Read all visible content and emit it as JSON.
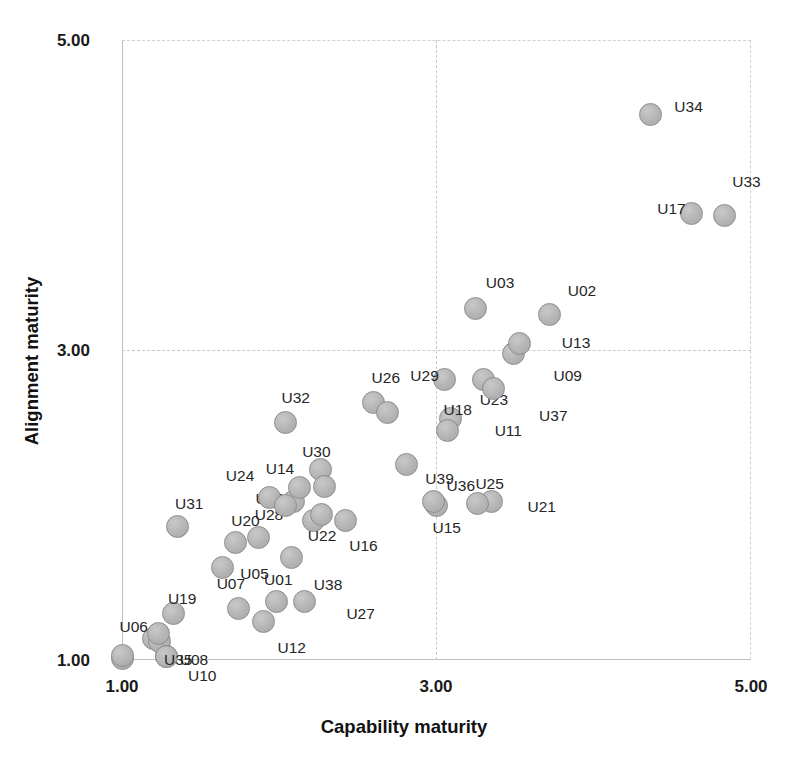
{
  "chart_data": {
    "type": "scatter",
    "title": "",
    "xlabel": "Capability maturity",
    "ylabel": "Alignment maturity",
    "xlim": [
      1.0,
      5.0
    ],
    "ylim": [
      1.0,
      5.0
    ],
    "xticks": [
      "1.00",
      "3.00",
      "5.00"
    ],
    "xtick_values": [
      1.0,
      3.0,
      5.0
    ],
    "yticks": [
      "1.00",
      "3.00",
      "5.00"
    ],
    "ytick_values": [
      1.0,
      3.0,
      5.0
    ],
    "grid": true,
    "legend": "none",
    "marker_fill": "#b4b4b4",
    "marker_edge": "#8c8c8c",
    "points": [
      {
        "label": "U01",
        "x": 1.98,
        "y": 1.38,
        "lx": -12,
        "ly": -22
      },
      {
        "label": "U02",
        "x": 3.72,
        "y": 3.23,
        "lx": 18,
        "ly": -24
      },
      {
        "label": "U03",
        "x": 3.25,
        "y": 3.27,
        "lx": 10,
        "ly": -26
      },
      {
        "label": "U04",
        "x": 2.09,
        "y": 2.02,
        "lx": -38,
        "ly": -4
      },
      {
        "label": "U05",
        "x": 1.74,
        "y": 1.33,
        "lx": 2,
        "ly": -36
      },
      {
        "label": "U06",
        "x": 1.2,
        "y": 1.14,
        "lx": -34,
        "ly": -12
      },
      {
        "label": "U07",
        "x": 1.64,
        "y": 1.6,
        "lx": -6,
        "ly": 16
      },
      {
        "label": "U08",
        "x": 1.24,
        "y": 1.12,
        "lx": 20,
        "ly": 18
      },
      {
        "label": "U09",
        "x": 3.49,
        "y": 2.98,
        "lx": 40,
        "ly": 22
      },
      {
        "label": "U10",
        "x": 1.28,
        "y": 1.02,
        "lx": 22,
        "ly": 18
      },
      {
        "label": "U11",
        "x": 3.09,
        "y": 2.56,
        "lx": 44,
        "ly": 12
      },
      {
        "label": "U12",
        "x": 1.9,
        "y": 1.25,
        "lx": 14,
        "ly": 26
      },
      {
        "label": "U13",
        "x": 3.53,
        "y": 3.04,
        "lx": 42,
        "ly": -2
      },
      {
        "label": "U14",
        "x": 2.13,
        "y": 2.11,
        "lx": -34,
        "ly": -20
      },
      {
        "label": "U15",
        "x": 3.0,
        "y": 2.0,
        "lx": -4,
        "ly": 22
      },
      {
        "label": "U16",
        "x": 2.42,
        "y": 1.9,
        "lx": 4,
        "ly": 24
      },
      {
        "label": "U17",
        "x": 4.62,
        "y": 3.88,
        "lx": -34,
        "ly": -6
      },
      {
        "label": "U18",
        "x": 3.07,
        "y": 2.48,
        "lx": -4,
        "ly": -22
      },
      {
        "label": "U19",
        "x": 1.33,
        "y": 1.3,
        "lx": -6,
        "ly": -16
      },
      {
        "label": "U20",
        "x": 1.72,
        "y": 1.76,
        "lx": -4,
        "ly": -22
      },
      {
        "label": "U21",
        "x": 3.35,
        "y": 2.02,
        "lx": 36,
        "ly": 4
      },
      {
        "label": "U22",
        "x": 2.22,
        "y": 1.9,
        "lx": -6,
        "ly": 14
      },
      {
        "label": "U23",
        "x": 3.3,
        "y": 2.81,
        "lx": -4,
        "ly": 20
      },
      {
        "label": "U24",
        "x": 1.94,
        "y": 2.05,
        "lx": -44,
        "ly": -22
      },
      {
        "label": "U25",
        "x": 3.26,
        "y": 2.01,
        "lx": -2,
        "ly": -20
      },
      {
        "label": "U26",
        "x": 2.6,
        "y": 2.66,
        "lx": -2,
        "ly": -26
      },
      {
        "label": "U27",
        "x": 2.16,
        "y": 1.38,
        "lx": 42,
        "ly": 12
      },
      {
        "label": "U28",
        "x": 1.87,
        "y": 1.79,
        "lx": -4,
        "ly": -24
      },
      {
        "label": "U29",
        "x": 3.05,
        "y": 2.81,
        "lx": -34,
        "ly": -4
      },
      {
        "label": "U30",
        "x": 2.26,
        "y": 2.23,
        "lx": -18,
        "ly": -18
      },
      {
        "label": "U31",
        "x": 1.35,
        "y": 1.86,
        "lx": -2,
        "ly": -24
      },
      {
        "label": "U32",
        "x": 2.04,
        "y": 2.53,
        "lx": -4,
        "ly": -26
      },
      {
        "label": "U33",
        "x": 4.83,
        "y": 3.87,
        "lx": 8,
        "ly": -34
      },
      {
        "label": "U34",
        "x": 4.36,
        "y": 4.52,
        "lx": 24,
        "ly": -8
      },
      {
        "label": "U35",
        "x": 1.28,
        "y": 1.02,
        "lx": -2,
        "ly": 2
      },
      {
        "label": "U36",
        "x": 2.81,
        "y": 2.26,
        "lx": 40,
        "ly": 20
      },
      {
        "label": "U37",
        "x": 3.36,
        "y": 2.75,
        "lx": 46,
        "ly": 26
      },
      {
        "label": "U38",
        "x": 2.08,
        "y": 1.66,
        "lx": 22,
        "ly": 26
      },
      {
        "label": "U39",
        "x": 2.98,
        "y": 2.02,
        "lx": -8,
        "ly": -24
      },
      {
        "label": "U00",
        "x": 1.0,
        "y": 1.01,
        "lx": 0,
        "ly": 0,
        "hide_label": true
      },
      {
        "label": "U06b",
        "x": 1.23,
        "y": 1.17,
        "lx": 0,
        "ly": 0,
        "hide_label": true
      },
      {
        "label": "U24b",
        "x": 2.04,
        "y": 2.0,
        "lx": 0,
        "ly": 0,
        "hide_label": true
      },
      {
        "label": "U30b",
        "x": 2.29,
        "y": 2.12,
        "lx": 0,
        "ly": 0,
        "hide_label": true
      },
      {
        "label": "U22b",
        "x": 2.27,
        "y": 1.94,
        "lx": 0,
        "ly": 0,
        "hide_label": true
      },
      {
        "label": "U26b",
        "x": 2.69,
        "y": 2.6,
        "lx": 0,
        "ly": 0,
        "hide_label": true
      },
      {
        "label": "U35b",
        "x": 1.0,
        "y": 1.03,
        "lx": 0,
        "ly": 0,
        "hide_label": true
      }
    ]
  },
  "axes": {
    "x_title": "Capability maturity",
    "y_title": "Alignment maturity",
    "y_tick_top": "5.00",
    "y_tick_mid": "3.00",
    "y_tick_bottom": "1.00",
    "x_tick_left": "1.00",
    "x_tick_mid": "3.00",
    "x_tick_right": "5.00"
  }
}
